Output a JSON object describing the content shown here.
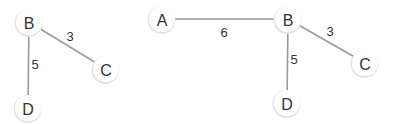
{
  "graphs": [
    {
      "name": "left-graph",
      "nodes": [
        {
          "id": "B",
          "label": "B",
          "x": 29,
          "y": 22
        },
        {
          "id": "C",
          "label": "C",
          "x": 106,
          "y": 69
        },
        {
          "id": "D",
          "label": "D",
          "x": 28,
          "y": 108
        }
      ],
      "edges": [
        {
          "from": "B",
          "to": "C",
          "weight": "3",
          "label_x": 70,
          "label_y": 36
        },
        {
          "from": "B",
          "to": "D",
          "weight": "5",
          "label_x": 35,
          "label_y": 64
        }
      ]
    },
    {
      "name": "right-graph",
      "nodes": [
        {
          "id": "A",
          "label": "A",
          "x": 162,
          "y": 19
        },
        {
          "id": "B",
          "label": "B",
          "x": 288,
          "y": 19
        },
        {
          "id": "C",
          "label": "C",
          "x": 365,
          "y": 63
        },
        {
          "id": "D",
          "label": "D",
          "x": 287,
          "y": 103
        }
      ],
      "edges": [
        {
          "from": "A",
          "to": "B",
          "weight": "6",
          "label_x": 224,
          "label_y": 32
        },
        {
          "from": "B",
          "to": "C",
          "weight": "3",
          "label_x": 330,
          "label_y": 31
        },
        {
          "from": "B",
          "to": "D",
          "weight": "5",
          "label_x": 294,
          "label_y": 59
        }
      ]
    }
  ],
  "style": {
    "edge_color": "#9a9a9a",
    "node_fill": "#ffffff",
    "text_color": "#333333"
  }
}
